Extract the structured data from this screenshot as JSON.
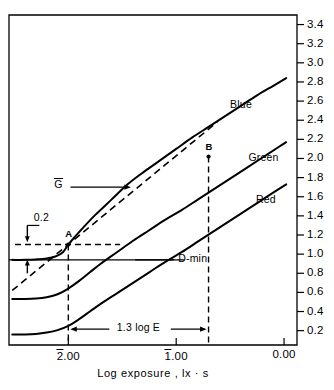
{
  "figure": {
    "kind": "sensitometric-characteristic-curve",
    "x_axis_title": "Log exposure , lx · s",
    "y_axis_title": ""
  },
  "chart_data": {
    "type": "line",
    "title": "",
    "xlabel": "Log exposure , lx · s",
    "ylabel": "",
    "xlim": [
      -2.55,
      0.12
    ],
    "ylim": [
      0.05,
      3.5
    ],
    "grid": false,
    "legend_position": "inline-right-of-curves",
    "x_tick_labels": [
      "2.00",
      "1.00",
      "0.00"
    ],
    "x_tick_values": [
      -2.0,
      -1.0,
      0.0
    ],
    "x_tick_overbar": [
      true,
      true,
      false
    ],
    "y_tick_labels": [
      "0.2",
      "0.4",
      "0.6",
      "0.8",
      "1.0",
      "1.2",
      "1.4",
      "1.6",
      "1.8",
      "2.0",
      "2.2",
      "2.4",
      "2.6",
      "2.8",
      "3.0",
      "3.2",
      "3.4"
    ],
    "y_tick_values": [
      0.2,
      0.4,
      0.6,
      0.8,
      1.0,
      1.2,
      1.4,
      1.6,
      1.8,
      2.0,
      2.2,
      2.4,
      2.6,
      2.8,
      3.0,
      3.2,
      3.4
    ],
    "series": [
      {
        "name": "Blue",
        "color": "#000000",
        "points": [
          [
            -2.52,
            0.94
          ],
          [
            -2.4,
            0.94
          ],
          [
            -2.3,
            0.945
          ],
          [
            -2.2,
            0.955
          ],
          [
            -2.12,
            0.975
          ],
          [
            -2.05,
            1.02
          ],
          [
            -2.0,
            1.1
          ],
          [
            -1.94,
            1.18
          ],
          [
            -1.86,
            1.28
          ],
          [
            -1.75,
            1.41
          ],
          [
            -1.6,
            1.57
          ],
          [
            -1.45,
            1.73
          ],
          [
            -1.3,
            1.86
          ],
          [
            -1.15,
            1.98
          ],
          [
            -1.0,
            2.1
          ],
          [
            -0.85,
            2.22
          ],
          [
            -0.7,
            2.33
          ],
          [
            -0.55,
            2.44
          ],
          [
            -0.4,
            2.55
          ],
          [
            -0.25,
            2.66
          ],
          [
            -0.1,
            2.76
          ],
          [
            0.02,
            2.84
          ]
        ]
      },
      {
        "name": "Green",
        "color": "#000000",
        "points": [
          [
            -2.52,
            0.53
          ],
          [
            -2.4,
            0.53
          ],
          [
            -2.3,
            0.535
          ],
          [
            -2.2,
            0.55
          ],
          [
            -2.1,
            0.58
          ],
          [
            -2.0,
            0.64
          ],
          [
            -1.9,
            0.72
          ],
          [
            -1.8,
            0.81
          ],
          [
            -1.7,
            0.9
          ],
          [
            -1.55,
            1.02
          ],
          [
            -1.4,
            1.14
          ],
          [
            -1.25,
            1.25
          ],
          [
            -1.1,
            1.36
          ],
          [
            -0.95,
            1.46
          ],
          [
            -0.8,
            1.57
          ],
          [
            -0.65,
            1.68
          ],
          [
            -0.5,
            1.79
          ],
          [
            -0.35,
            1.9
          ],
          [
            -0.2,
            2.01
          ],
          [
            -0.05,
            2.12
          ],
          [
            0.02,
            2.17
          ]
        ]
      },
      {
        "name": "Red",
        "color": "#000000",
        "points": [
          [
            -2.52,
            0.16
          ],
          [
            -2.4,
            0.16
          ],
          [
            -2.3,
            0.165
          ],
          [
            -2.2,
            0.18
          ],
          [
            -2.1,
            0.205
          ],
          [
            -2.0,
            0.25
          ],
          [
            -1.9,
            0.32
          ],
          [
            -1.8,
            0.4
          ],
          [
            -1.7,
            0.48
          ],
          [
            -1.55,
            0.59
          ],
          [
            -1.4,
            0.7
          ],
          [
            -1.25,
            0.81
          ],
          [
            -1.1,
            0.92
          ],
          [
            -0.95,
            1.02
          ],
          [
            -0.8,
            1.13
          ],
          [
            -0.65,
            1.24
          ],
          [
            -0.5,
            1.35
          ],
          [
            -0.35,
            1.46
          ],
          [
            -0.2,
            1.57
          ],
          [
            -0.05,
            1.68
          ],
          [
            0.02,
            1.73
          ]
        ]
      }
    ],
    "tangent_line": {
      "label": "G-bar",
      "description": "dashed average-gradient line through points A and B",
      "from": [
        -2.52,
        0.62
      ],
      "to": [
        -0.62,
        2.38
      ],
      "slope_points": [
        "A",
        "B"
      ]
    },
    "markers": [
      {
        "label": "A",
        "x": -2.0,
        "y": 1.1
      },
      {
        "label": "B",
        "x": -0.7,
        "y": 2.02
      }
    ],
    "reference_lines": [
      {
        "name": "d-min-line",
        "type": "horizontal",
        "y": 0.94,
        "label": "D-min"
      },
      {
        "name": "a-horizontal-dash",
        "type": "horizontal-dashed",
        "y": 1.1
      },
      {
        "name": "a-vertical-dash",
        "type": "vertical-dashed",
        "x": -2.0
      },
      {
        "name": "b-vertical-dash",
        "type": "vertical-dashed",
        "x": -0.7
      }
    ],
    "annotations": [
      {
        "name": "delta-density",
        "text": "0.2",
        "x": -2.38,
        "y": 1.28
      },
      {
        "name": "gradient-symbol",
        "text": "G",
        "overbar": true,
        "x": -2.1,
        "y": 1.72
      },
      {
        "name": "log-e-span",
        "text": "1.3 log E",
        "x": -1.35,
        "y": 0.215
      },
      {
        "name": "d-min",
        "text": "D-min",
        "x": -1.3,
        "y": 0.94
      }
    ]
  },
  "labels": {
    "blue": "Blue",
    "green": "Green",
    "red": "Red",
    "point_a": "A",
    "point_b": "B",
    "delta_density": "0.2",
    "gradient": "G",
    "log_e_span": "1.3 log E",
    "d_min": "D-min",
    "x_axis_title": "Log exposure , lx · s"
  },
  "ticks": {
    "y": [
      "0.2",
      "0.4",
      "0.6",
      "0.8",
      "1.0",
      "1.2",
      "1.4",
      "1.6",
      "1.8",
      "2.0",
      "2.2",
      "2.4",
      "2.6",
      "2.8",
      "3.0",
      "3.2",
      "3.4"
    ],
    "x": [
      "2.00",
      "1.00",
      "0.00"
    ]
  }
}
